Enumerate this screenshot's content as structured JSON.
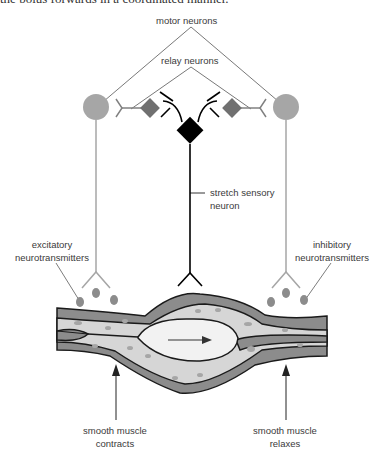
{
  "caption_fragment": "the bolus forwards in a coordinated manner.",
  "labels": {
    "motor_neurons": "motor neurons",
    "relay_neurons": "relay neurons",
    "stretch_sensory_line1": "stretch sensory",
    "stretch_sensory_line2": "neuron",
    "excitatory_line1": "excitatory",
    "excitatory_line2": "neurotransmitters",
    "inhibitory_line1": "inhibitory",
    "inhibitory_line2": "neurotransmitters",
    "contracts_line1": "smooth muscle",
    "contracts_line2": "contracts",
    "relaxes_line1": "smooth muscle",
    "relaxes_line2": "relaxes"
  },
  "colors": {
    "motor_neuron": "#a6a6a6",
    "relay_neuron": "#707070",
    "sensory_neuron": "#000000",
    "muscle_layer": "#8c8c8c",
    "mucosa": "#d6d6d6",
    "bolus": "#f2f2f2"
  }
}
